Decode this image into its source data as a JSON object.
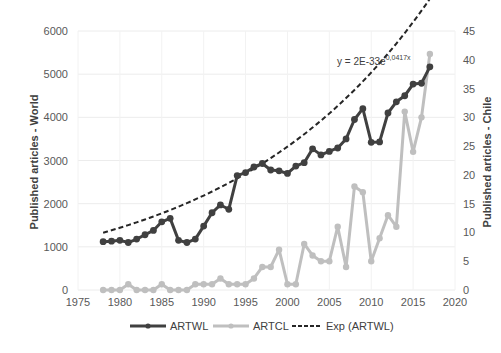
{
  "chart_data": {
    "type": "line",
    "title": "",
    "xlabel": "",
    "ylabel": "Published articles - World",
    "ylabel_right": "Published articles - Chile",
    "xlim": [
      1975,
      2020
    ],
    "ylim": [
      0,
      6000
    ],
    "ylim_right": [
      0,
      45
    ],
    "x_ticks": [
      1975,
      1980,
      1985,
      1990,
      1995,
      2000,
      2005,
      2010,
      2015,
      2020
    ],
    "y_ticks": [
      0,
      1000,
      2000,
      3000,
      4000,
      5000,
      6000
    ],
    "y_ticks_right": [
      0,
      5,
      10,
      15,
      20,
      25,
      30,
      35,
      40,
      45
    ],
    "grid": true,
    "legend_position": "bottom",
    "x": [
      1978,
      1979,
      1980,
      1981,
      1982,
      1983,
      1984,
      1985,
      1986,
      1987,
      1988,
      1989,
      1990,
      1991,
      1992,
      1993,
      1994,
      1995,
      1996,
      1997,
      1998,
      1999,
      2000,
      2001,
      2002,
      2003,
      2004,
      2005,
      2006,
      2007,
      2008,
      2009,
      2010,
      2011,
      2012,
      2013,
      2014,
      2015,
      2016,
      2017
    ],
    "series": [
      {
        "name": "ARTWL",
        "axis": "left",
        "color": "#404040",
        "values": [
          1120,
          1130,
          1150,
          1100,
          1180,
          1280,
          1380,
          1580,
          1660,
          1150,
          1100,
          1180,
          1480,
          1790,
          1970,
          1870,
          2650,
          2720,
          2850,
          2930,
          2780,
          2760,
          2700,
          2870,
          2950,
          3270,
          3130,
          3210,
          3290,
          3500,
          3950,
          4200,
          3420,
          3430,
          4100,
          4360,
          4500,
          4770,
          4790,
          5170
        ]
      },
      {
        "name": "ARTCL",
        "axis": "right",
        "color": "#bfbfbf",
        "values": [
          0,
          0,
          0,
          1,
          0,
          0,
          0,
          1,
          0,
          0,
          0,
          1,
          1,
          1,
          2,
          1,
          1,
          1,
          2,
          4,
          4,
          7,
          1,
          1,
          8,
          6,
          5,
          5,
          11,
          4,
          18,
          17,
          5,
          9,
          13,
          11,
          31,
          24,
          30,
          41
        ]
      },
      {
        "name": "Exp (ARTWL)",
        "axis": "left",
        "style": "dashed",
        "color": "#262626",
        "trendline": "exponential",
        "coefficient": 2e-33,
        "rate": 0.0417
      }
    ],
    "annotations": [
      {
        "text": "y = 2E-33e",
        "superscript": "0,0417x"
      }
    ]
  }
}
